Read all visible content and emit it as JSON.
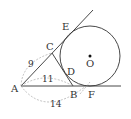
{
  "diagram": {
    "points": {
      "A": "A",
      "B": "B",
      "C": "C",
      "D": "D",
      "E": "E",
      "F": "F",
      "O": "O"
    },
    "measurements": {
      "AC": "9",
      "AB": "11",
      "AF": "14"
    },
    "colors": {
      "line": "#333333",
      "dashed": "#888888"
    }
  }
}
